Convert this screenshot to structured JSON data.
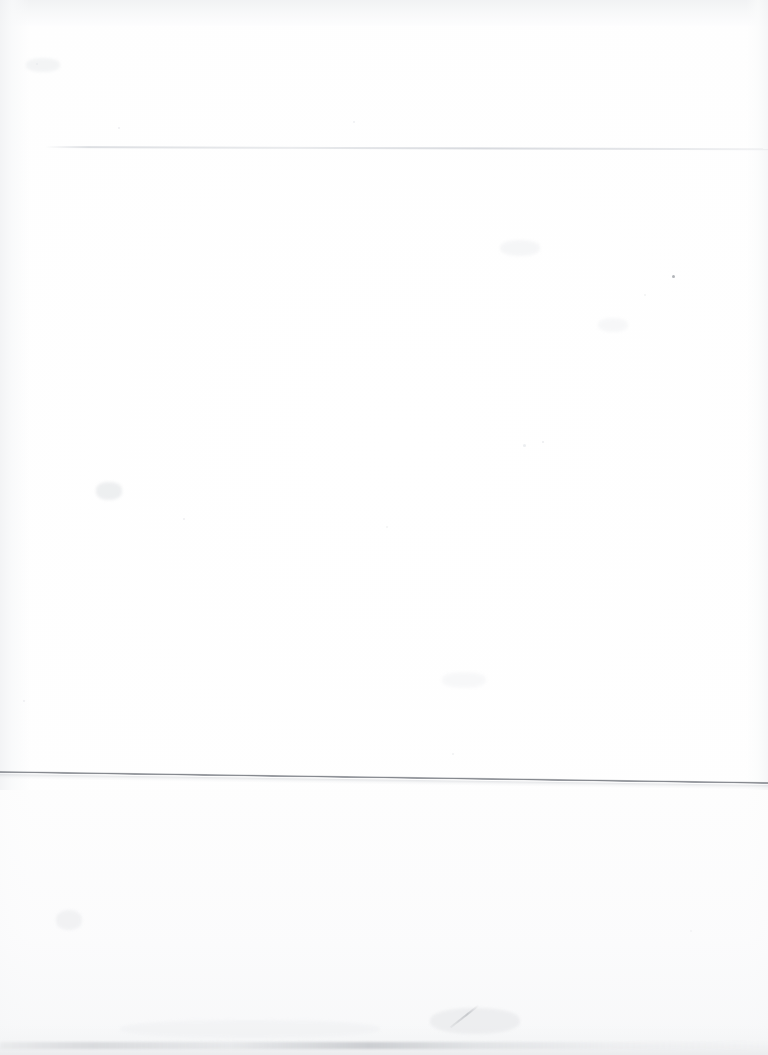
{
  "document": {
    "kind": "scanned-blank-page",
    "description": "Blank scanned sheet of paper with no printed text or graphics",
    "page_width": 768,
    "page_height": 1055,
    "text_content": "",
    "background_color": "#fefefe",
    "paper_tone": "#fbfbfc"
  },
  "artifacts": {
    "faint_rule": {
      "name": "faint-horizontal-rule",
      "color": "#d4d7dc",
      "start_x": 45,
      "end_x": 768,
      "y": 146,
      "thickness_px": 2
    },
    "edge_line": {
      "name": "paper-edge-line",
      "color": "#83868c",
      "start_x": 0,
      "start_y": 771,
      "end_x": 768,
      "end_y": 782,
      "thickness_px": 2,
      "angle_deg": 0.82
    },
    "bottom_band": {
      "name": "bottom-smudge-band",
      "color": "#c4c6ca",
      "y": 1042,
      "thickness_px": 7
    },
    "shading": {
      "top_edge": "#eff0f2",
      "left_edge": "#f0f1f3",
      "right_edge": "#f2f3f5",
      "bottom_edge": "#e9eaec"
    },
    "specks": [
      {
        "name": "speck-dark-upper-right",
        "x": 672,
        "y": 275,
        "size": 3,
        "color": "#9ea1a6",
        "opacity": 0.8
      },
      {
        "name": "speck-upper-left",
        "x": 36,
        "y": 63,
        "size": 2,
        "color": "#dfe1e4",
        "opacity": 0.7
      },
      {
        "name": "speck-mid-left",
        "x": 118,
        "y": 127,
        "size": 2,
        "color": "#e2e4e7",
        "opacity": 0.6
      },
      {
        "name": "speck-mid-upper",
        "x": 353,
        "y": 121,
        "size": 2,
        "color": "#e4e6e9",
        "opacity": 0.6
      },
      {
        "name": "speck-center-left",
        "x": 183,
        "y": 518,
        "size": 2,
        "color": "#e3e5e8",
        "opacity": 0.6
      },
      {
        "name": "speck-center",
        "x": 386,
        "y": 526,
        "size": 2,
        "color": "#e6e7ea",
        "opacity": 0.5
      },
      {
        "name": "speck-center-right",
        "x": 523,
        "y": 444,
        "size": 3,
        "color": "#e0e2e6",
        "opacity": 0.6
      },
      {
        "name": "speck-lower-center",
        "x": 542,
        "y": 441,
        "size": 2,
        "color": "#dde0e4",
        "opacity": 0.6
      },
      {
        "name": "speck-right-mid",
        "x": 644,
        "y": 294,
        "size": 2,
        "color": "#e5e7ea",
        "opacity": 0.5
      },
      {
        "name": "speck-lower-left",
        "x": 23,
        "y": 700,
        "size": 2,
        "color": "#e2e4e7",
        "opacity": 0.6
      },
      {
        "name": "speck-bottom-center",
        "x": 452,
        "y": 753,
        "size": 2,
        "color": "#e4e6e9",
        "opacity": 0.5
      },
      {
        "name": "speck-bottom-right",
        "x": 690,
        "y": 930,
        "size": 2,
        "color": "#ebecee",
        "opacity": 0.5
      }
    ],
    "smudges": [
      {
        "name": "smudge-left-mid",
        "x": 96,
        "y": 482,
        "w": 26,
        "h": 18,
        "color": "#e8eaec",
        "opacity": 0.75
      },
      {
        "name": "smudge-lower-left",
        "x": 56,
        "y": 910,
        "w": 26,
        "h": 20,
        "color": "#edeef0",
        "opacity": 0.7
      },
      {
        "name": "smudge-upper-left",
        "x": 26,
        "y": 58,
        "w": 34,
        "h": 14,
        "color": "#eceef0",
        "opacity": 0.6
      },
      {
        "name": "smudge-upper-mid",
        "x": 500,
        "y": 240,
        "w": 40,
        "h": 16,
        "color": "#f0f1f3",
        "opacity": 0.6
      },
      {
        "name": "smudge-mid-right",
        "x": 598,
        "y": 318,
        "w": 30,
        "h": 14,
        "color": "#f1f2f4",
        "opacity": 0.55
      },
      {
        "name": "smudge-lower-mid",
        "x": 442,
        "y": 672,
        "w": 44,
        "h": 16,
        "color": "#f1f2f4",
        "opacity": 0.5
      },
      {
        "name": "smudge-bottom-mid",
        "x": 430,
        "y": 1008,
        "w": 90,
        "h": 26,
        "color": "#e9eaec",
        "opacity": 0.7
      },
      {
        "name": "smudge-bottom-wide",
        "x": 120,
        "y": 1020,
        "w": 260,
        "h": 18,
        "color": "#f0f1f3",
        "opacity": 0.6
      }
    ],
    "scratch": {
      "name": "diagonal-scratch-mark",
      "x": 478,
      "y": 1005,
      "length": 36,
      "angle_deg": 52,
      "color": "#a8abb0"
    }
  }
}
